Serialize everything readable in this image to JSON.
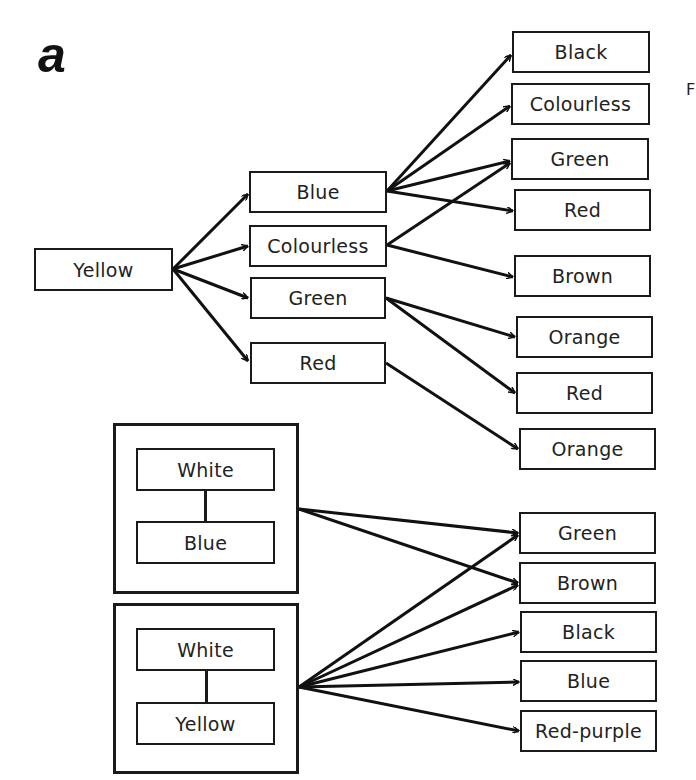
{
  "panel_label": "a",
  "cut_label": "F",
  "tree": {
    "root": "Yellow",
    "level1": [
      "Blue",
      "Colourless",
      "Green",
      "Red"
    ],
    "level2": [
      "Black",
      "Colourless",
      "Green",
      "Red",
      "Brown",
      "Orange",
      "Red",
      "Orange"
    ],
    "edges": [
      {
        "from": "Yellow",
        "to": "Blue"
      },
      {
        "from": "Yellow",
        "to": "Colourless"
      },
      {
        "from": "Yellow",
        "to": "Green"
      },
      {
        "from": "Yellow",
        "to": "Red"
      },
      {
        "from": "Blue",
        "to": "Black"
      },
      {
        "from": "Blue",
        "to": "Colourless"
      },
      {
        "from": "Blue",
        "to": "Green"
      },
      {
        "from": "Blue",
        "to": "Red"
      },
      {
        "from": "Colourless",
        "to": "Green"
      },
      {
        "from": "Colourless",
        "to": "Brown"
      },
      {
        "from": "Green",
        "to": "Orange"
      },
      {
        "from": "Green",
        "to": "Red"
      },
      {
        "from": "Red",
        "to": "Orange"
      }
    ]
  },
  "mixtures": [
    {
      "top": "White",
      "bottom": "Blue",
      "outcomes": [
        "Green",
        "Brown"
      ]
    },
    {
      "top": "White",
      "bottom": "Yellow",
      "outcomes": [
        "Green",
        "Brown",
        "Black",
        "Blue",
        "Red-purple"
      ]
    }
  ],
  "mixture_targets": [
    "Green",
    "Brown",
    "Black",
    "Blue",
    "Red-purple"
  ]
}
